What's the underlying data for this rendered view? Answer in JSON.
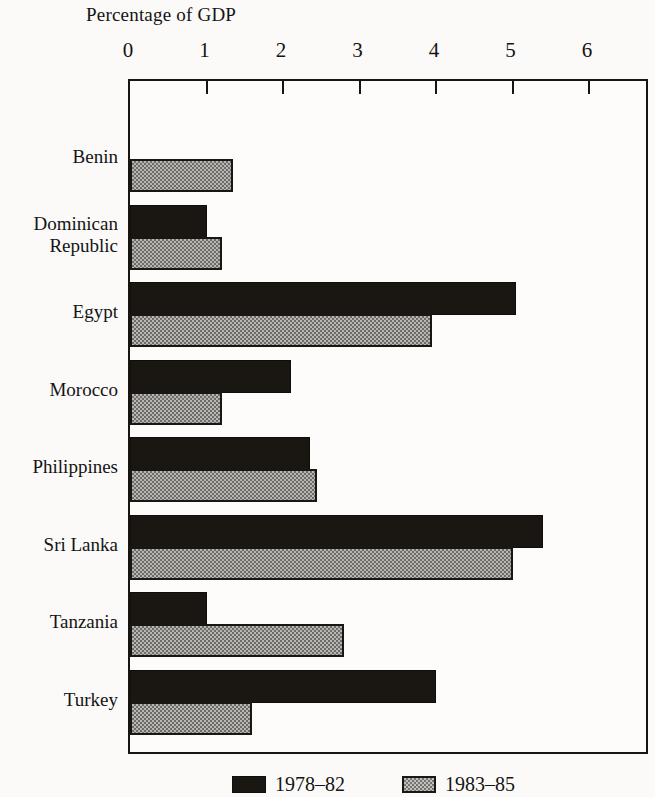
{
  "chart_data": {
    "type": "bar",
    "orientation": "horizontal",
    "title": "Percentage of GDP",
    "xlabel": "Percentage of GDP",
    "ylabel": "",
    "xlim": [
      0,
      7
    ],
    "xticks": [
      0,
      1,
      2,
      3,
      4,
      5,
      6,
      7
    ],
    "xtick_labels": [
      "0",
      "1",
      "2",
      "3",
      "4",
      "5",
      "6",
      "7"
    ],
    "grid": false,
    "legend_position": "bottom",
    "categories": [
      "Benin",
      "Dominican\nRepublic",
      "Egypt",
      "Morocco",
      "Philippines",
      "Sri Lanka",
      "Tanzania",
      "Turkey"
    ],
    "series": [
      {
        "name": "1978–82",
        "color": "#1a1713",
        "values": [
          null,
          1.0,
          5.05,
          2.1,
          2.35,
          5.4,
          1.0,
          4.0
        ]
      },
      {
        "name": "1983–85",
        "color": "#b8b6b2",
        "values": [
          1.35,
          1.2,
          3.95,
          1.2,
          2.45,
          5.0,
          2.8,
          1.6
        ]
      }
    ]
  },
  "legend": {
    "entries": [
      {
        "label": "1978–82",
        "swatch": "solid-black-swatch"
      },
      {
        "label": "1983–85",
        "swatch": "stippled-gray-swatch"
      }
    ]
  }
}
